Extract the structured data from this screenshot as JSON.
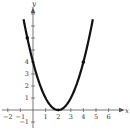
{
  "chart_data": {
    "type": "line",
    "title": "",
    "xlabel": "x",
    "ylabel": "y",
    "function": "y = (x - 2)^2",
    "x_ticks": [
      -2,
      -1,
      1,
      2,
      3,
      4,
      5,
      6
    ],
    "y_ticks": [
      -1,
      1,
      2,
      3,
      4
    ],
    "y_unlabeled_ticks": [
      5,
      6,
      7,
      8
    ],
    "xlim": [
      -2.5,
      7
    ],
    "ylim": [
      -1.5,
      8.7
    ],
    "grid": false,
    "series": [
      {
        "name": "parabola",
        "x": [
          -0.75,
          -0.5,
          0,
          0.5,
          1,
          1.5,
          2,
          2.5,
          3,
          3.5,
          4,
          4.5,
          4.75
        ],
        "values": [
          7.56,
          6.25,
          4,
          2.25,
          1,
          0.25,
          0,
          0.25,
          1,
          2.25,
          4,
          6.25,
          7.56
        ]
      }
    ],
    "marked_points": [
      {
        "x": -0.45,
        "y": 6
      },
      {
        "x": 4,
        "y": 4
      }
    ],
    "vertex": {
      "x": 2,
      "y": 0
    }
  },
  "axes": {
    "x_label": "x",
    "y_label": "y",
    "x_tick_labels": [
      "−2",
      "−1",
      "1",
      "2",
      "3",
      "4",
      "5",
      "6"
    ],
    "y_tick_labels": [
      "−1",
      "1",
      "2",
      "3",
      "4"
    ]
  },
  "colors": {
    "curve": "#111111",
    "axis": "#555555",
    "text": "#333333"
  }
}
